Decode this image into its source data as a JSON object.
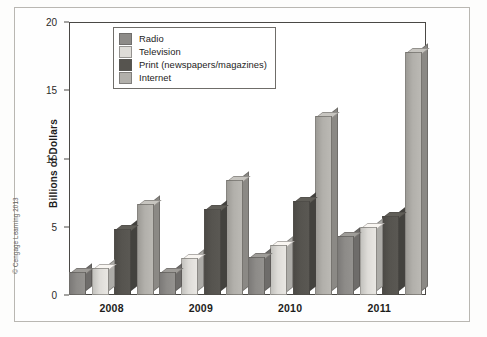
{
  "figure": {
    "copyright": "© Cengage Learning 2013"
  },
  "legend": {
    "position": "top-left-inside",
    "items": [
      {
        "label": "Radio",
        "color": "#8d8b88"
      },
      {
        "label": "Television",
        "color": "#dedcd8"
      },
      {
        "label": "Print (newspapers/magazines)",
        "color": "#56544f"
      },
      {
        "label": "Internet",
        "color": "#b2b0ab"
      }
    ]
  },
  "axes": {
    "y_label": "Billions of Dollars",
    "y_ticks": [
      "0",
      "5",
      "10",
      "15",
      "20"
    ],
    "x_ticks": [
      "2008",
      "2009",
      "2010",
      "2011"
    ]
  },
  "chart_data": {
    "type": "bar",
    "title": "",
    "xlabel": "",
    "ylabel": "Billions of Dollars",
    "ylim": [
      0,
      20
    ],
    "yticks": [
      0,
      5,
      10,
      15,
      20
    ],
    "grid": false,
    "legend_position": "upper left",
    "categories": [
      "2008",
      "2009",
      "2010",
      "2011"
    ],
    "series": [
      {
        "name": "Radio",
        "color": "#8d8b88",
        "values": [
          1.7,
          1.7,
          2.8,
          4.3
        ]
      },
      {
        "name": "Television",
        "color": "#dedcd8",
        "values": [
          2.0,
          2.7,
          3.7,
          5.0
        ]
      },
      {
        "name": "Print (newspapers/magazines)",
        "color": "#56544f",
        "values": [
          4.8,
          6.3,
          6.9,
          5.8
        ]
      },
      {
        "name": "Internet",
        "color": "#b2b0ab",
        "values": [
          6.7,
          8.4,
          13.1,
          17.8
        ]
      }
    ]
  }
}
